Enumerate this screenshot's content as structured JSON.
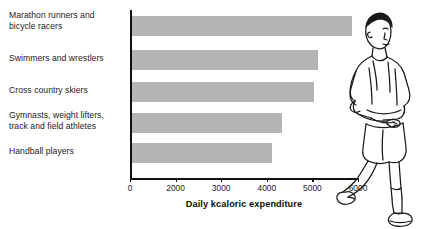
{
  "chart_data": {
    "type": "bar",
    "orientation": "horizontal",
    "title": "",
    "xlabel": "Daily kcaloric expenditure",
    "ylabel": "",
    "categories": [
      "Marathon runners and\nbicycle racers",
      "Swimmers and wrestlers",
      "Cross country skiers",
      "Gymnasts, weight lifters,\ntrack and field athletes",
      "Handball players"
    ],
    "values": [
      5800,
      4900,
      4800,
      3950,
      3700
    ],
    "xlim": [
      0,
      6000
    ],
    "xticks": [
      0,
      2000,
      3000,
      4000,
      5000,
      6000
    ],
    "xtick_labels": [
      "0",
      "2000",
      "3000",
      "4000",
      "5000",
      "6000"
    ],
    "grid": false,
    "legend": false,
    "bar_color": "#b4b4b4",
    "axis_color": "#111111"
  },
  "illustration": {
    "name": "runner-illustration",
    "description": "line drawing of a running athlete"
  }
}
